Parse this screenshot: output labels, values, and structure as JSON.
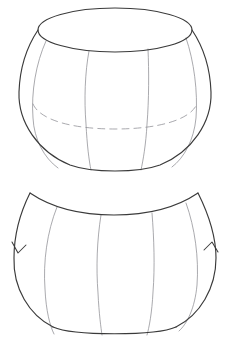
{
  "page": {
    "background_color": "#ffffff",
    "width": 228,
    "height": 350,
    "title": "Geometric solid of revolution and its developed lune panel"
  },
  "palette": {
    "outline": "#3a3a3a",
    "meridian": "#8e8e93",
    "hidden_edge": "#9a9a9f",
    "surface": "#ffffff",
    "arrow": "#3a3a3a"
  },
  "figures": [
    {
      "id": "barrel-solid",
      "name": "Open barrel solid with elliptical rim",
      "region": {
        "x": 18,
        "y": 7,
        "width": 194,
        "height": 163
      },
      "parts": {
        "top_rim_ellipse": {
          "name": "top elliptical opening",
          "center_x": 115,
          "center_y": 30,
          "radius_x": 78,
          "radius_y": 22,
          "style": "solid"
        },
        "silhouette": {
          "name": "outer barrel silhouette",
          "left_extreme_x": 19,
          "right_extreme_x": 211,
          "widest_y": 92,
          "bottom_y": 169,
          "style": "solid"
        },
        "hidden_back_rim": {
          "name": "dashed hidden back rim of base",
          "center_x": 115,
          "center_y": 105,
          "radius_x": 82,
          "radius_y": 22,
          "style": "dashed"
        },
        "meridian_count": 4,
        "meridian_x_positions": [
          33,
          88,
          145,
          196
        ]
      }
    },
    {
      "id": "lune-panel",
      "name": "Developed lune panel with orientation arrows",
      "region": {
        "x": 13,
        "y": 191,
        "width": 204,
        "height": 143
      },
      "parts": {
        "top_arc": {
          "name": "concave top arc between cusps",
          "left_cusp_x": 30,
          "left_cusp_y": 193,
          "right_cusp_x": 198,
          "right_cusp_y": 193,
          "sag_y": 214,
          "style": "solid"
        },
        "bottom_arc": {
          "name": "convex bottom arc",
          "lowest_y": 333,
          "style": "solid"
        },
        "left_edge": {
          "name": "left convex side edge",
          "extreme_x": 14,
          "extreme_y": 258
        },
        "right_edge": {
          "name": "right convex side edge",
          "extreme_x": 216,
          "extreme_y": 258
        },
        "meridian_count": 4,
        "meridian_x_positions": [
          45,
          100,
          155,
          200
        ],
        "arrows": [
          {
            "name": "left-edge-direction-arrow",
            "x": 19,
            "y": 249,
            "direction": "down"
          },
          {
            "name": "right-edge-direction-arrow",
            "x": 211,
            "y": 249,
            "direction": "down"
          }
        ]
      }
    }
  ]
}
